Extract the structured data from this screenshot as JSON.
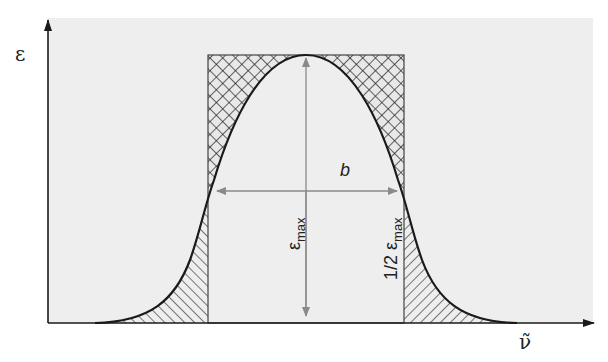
{
  "figure": {
    "y_axis_label": "ε",
    "x_axis_label": "ν̃",
    "width_label": "b",
    "peak_label": {
      "symbol": "ε",
      "subscript": "max"
    },
    "half_peak_label": {
      "prefix": "1/2 ",
      "symbol": "ε",
      "subscript": "max"
    },
    "colors": {
      "background": "#eeeeee",
      "curve": "#1a1a1a",
      "axes": "#1a1a1a",
      "arrows": "#8a8a8a",
      "hatch": "#333333"
    },
    "legend_areas": [
      {
        "name": "excess-rectangle-area",
        "pattern": "cross-hatch"
      },
      {
        "name": "excess-band-wing-area",
        "pattern": "diagonal-hatch"
      }
    ]
  }
}
